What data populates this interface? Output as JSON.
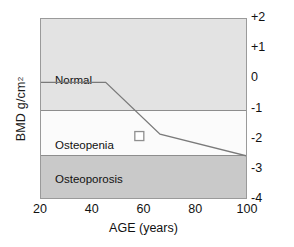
{
  "chart_data": {
    "type": "area",
    "title": "",
    "xlabel": "AGE (years)",
    "ylabel": "BMD  g/cm",
    "ylabel_sup": "2",
    "xlim": [
      20,
      100
    ],
    "ylim": [
      -4,
      2
    ],
    "xticks": [
      "20",
      "40",
      "60",
      "80",
      "100"
    ],
    "xtick_values": [
      20,
      40,
      60,
      80,
      100
    ],
    "yticks": [
      "+2",
      "+1",
      "0",
      "-1",
      "-2",
      "-3",
      "-4"
    ],
    "ytick_values": [
      2,
      1,
      0,
      -1,
      -2,
      -3,
      -4
    ],
    "ytick_position": "right",
    "grid": false,
    "legend": "none",
    "bands": [
      {
        "label": "Normal",
        "from": 2,
        "to": -1,
        "color": "#e3e3e3",
        "label_y": -0.05
      },
      {
        "label": "Osteopenia",
        "from": -1,
        "to": -2.5,
        "color": "#fbfbfb",
        "label_y": -2.2
      },
      {
        "label": "Osteoporosis",
        "from": -2.5,
        "to": -4,
        "color": "#c9c9c9",
        "label_y": -3.35
      }
    ],
    "series": [
      {
        "name": "Mean BMD with age",
        "color": "#7a7a7a",
        "x": [
          20,
          45,
          66,
          100
        ],
        "values": [
          -0.1,
          -0.1,
          -1.82,
          -2.55
        ]
      }
    ],
    "points": [
      {
        "name": "patient-measurement",
        "marker": "open-square",
        "x": 58,
        "y": -1.88,
        "fill": "#ffffff",
        "stroke": "#8f8f8f"
      }
    ]
  }
}
